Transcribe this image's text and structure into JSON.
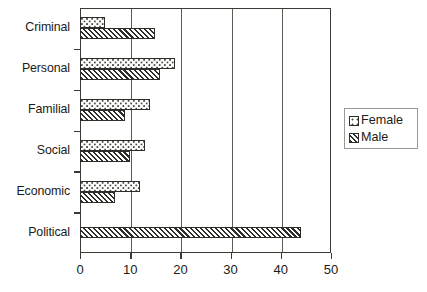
{
  "chart_data": {
    "type": "bar",
    "orientation": "horizontal",
    "title": "",
    "xlabel": "",
    "ylabel": "",
    "xlim": [
      0,
      50
    ],
    "ylim": null,
    "grid": true,
    "grid_axis": "x",
    "legend_position": "right",
    "categories": [
      "Criminal",
      "Personal",
      "Familial",
      "Social",
      "Economic",
      "Political"
    ],
    "xticks": [
      0,
      10,
      20,
      30,
      40,
      50
    ],
    "xticklabels": [
      "0",
      "10",
      "20",
      "30",
      "40",
      "50"
    ],
    "series": [
      {
        "name": "Female",
        "pattern": "dotted",
        "values": [
          5,
          19,
          14,
          13,
          12,
          0
        ]
      },
      {
        "name": "Male",
        "pattern": "diagonal-hatch",
        "values": [
          15,
          16,
          9,
          10,
          7,
          44
        ]
      }
    ]
  },
  "legend": {
    "items": [
      {
        "label": "Female",
        "swatch": "dotted-swatch-icon"
      },
      {
        "label": "Male",
        "swatch": "hatched-swatch-icon"
      }
    ]
  },
  "colors": {
    "axis": "#3a3a34",
    "grid": "#5c5c52",
    "bar_outline": "#2e2e28",
    "text": "#1b1b17",
    "background": "#ffffff",
    "legend_border": "#9a9a92"
  }
}
